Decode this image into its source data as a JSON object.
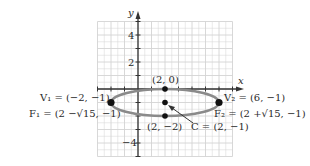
{
  "chart_data": {
    "type": "scatter",
    "title": "",
    "xlabel": "x",
    "ylabel": "y",
    "xlim": [
      -3,
      7
    ],
    "ylim": [
      -5,
      5
    ],
    "grid": true,
    "legend": null,
    "y_tick_labels": [
      {
        "value": 4,
        "label": "4"
      },
      {
        "value": 2,
        "label": "2"
      },
      {
        "value": -4,
        "label": "−4"
      }
    ],
    "ellipse": {
      "center": [
        2,
        -1
      ],
      "semi_major_x": 4,
      "semi_minor_y": 1,
      "color": "#8a8a8a"
    },
    "points": [
      {
        "name": "V1",
        "x": -2,
        "y": -1
      },
      {
        "name": "V2",
        "x": 6,
        "y": -1
      },
      {
        "name": "top",
        "x": 2,
        "y": 0
      },
      {
        "name": "C",
        "x": 2,
        "y": -1
      },
      {
        "name": "bottom",
        "x": 2,
        "y": -2
      }
    ],
    "annotations": [
      {
        "id": "v1",
        "text": "V₁ = (−2, −1)"
      },
      {
        "id": "f1",
        "text": "F₁ = (2 −√15, −1)"
      },
      {
        "id": "top",
        "text": "(2, 0)"
      },
      {
        "id": "v2",
        "text": "V₂ = (6, −1)"
      },
      {
        "id": "f2",
        "text": "F₂ = (2 +√15, −1)"
      },
      {
        "id": "bottom",
        "text": "(2, −2)"
      },
      {
        "id": "c",
        "text": "C = (2, −1)"
      }
    ]
  },
  "labels": {
    "x_axis": "x",
    "y_axis": "y",
    "tick_4": "4",
    "tick_2": "2",
    "tick_neg4": "−4",
    "v1": "V₁ = (−2, −1)",
    "f1": "F₁ = (2 −√15, −1)",
    "top": "(2, 0)",
    "v2": "V₂ = (6, −1)",
    "f2": "F₂ = (2 +√15, −1)",
    "bottom": "(2, −2)",
    "c": "C = (2, −1)"
  },
  "colors": {
    "grid": "#d4d4d4",
    "axis": "#333333",
    "ellipse": "#8a8a8a",
    "point": "#111111"
  }
}
